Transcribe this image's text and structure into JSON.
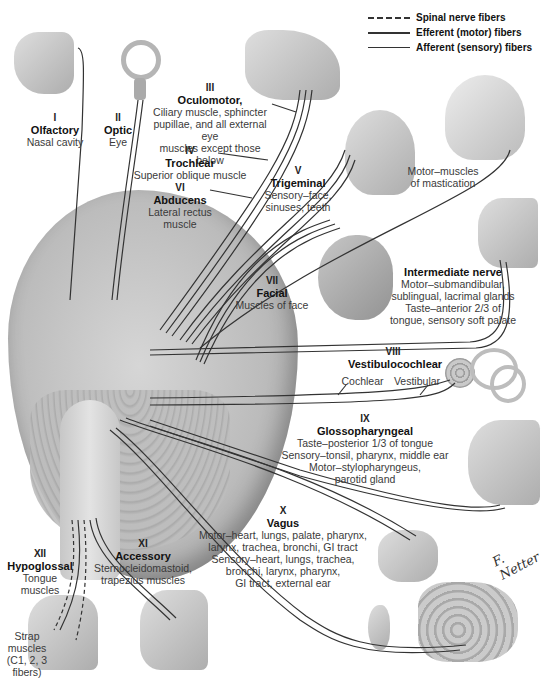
{
  "legend": {
    "items": [
      {
        "style": "dashed",
        "label": "Spinal nerve fibers"
      },
      {
        "style": "solid",
        "label": "Efferent (motor) fibers"
      },
      {
        "style": "thin",
        "label": "Afferent (sensory) fibers"
      }
    ]
  },
  "nerves": {
    "I": {
      "num": "I",
      "name": "Olfactory",
      "desc": [
        "Nasal cavity"
      ]
    },
    "II": {
      "num": "II",
      "name": "Optic",
      "desc": [
        "Eye"
      ]
    },
    "III": {
      "num": "III",
      "name": "Oculomotor,",
      "desc": [
        "Ciliary muscle, sphincter",
        "pupillae, and all external eye",
        "muscles except those below"
      ]
    },
    "IV": {
      "num": "IV",
      "name": "Trochlear",
      "desc": [
        "Superior oblique muscle"
      ]
    },
    "V": {
      "num": "V",
      "name": "Trigeminal",
      "desc": [
        "Sensory–face,",
        "sinuses, teeth"
      ],
      "motor_note": [
        "Motor–muscles",
        "of mastication"
      ]
    },
    "VI": {
      "num": "VI",
      "name": "Abducens",
      "desc": [
        "Lateral rectus",
        "muscle"
      ]
    },
    "VII": {
      "num": "VII",
      "name": "Facial",
      "desc": [
        "Muscles of face"
      ]
    },
    "intermediate": {
      "name": "Intermediate nerve",
      "desc": [
        "Motor–submandibular,",
        "sublingual, lacrimal glands",
        "Taste–anterior 2/3 of",
        "tongue, sensory soft palate"
      ]
    },
    "VIII": {
      "num": "VIII",
      "name": "Vestibulocochlear",
      "branches": [
        "Cochlear",
        "Vestibular"
      ]
    },
    "IX": {
      "num": "IX",
      "name": "Glossopharyngeal",
      "desc": [
        "Taste–posterior 1/3 of tongue",
        "Sensory–tonsil, pharynx, middle ear",
        "Motor–stylopharyngeus,",
        "parotid gland"
      ]
    },
    "X": {
      "num": "X",
      "name": "Vagus",
      "desc": [
        "Motor–heart, lungs, palate, pharynx,",
        "larynx, trachea, bronchi, GI tract",
        "Sensory–heart, lungs, trachea,",
        "bronchi, larynx, pharynx,",
        "GI tract, external ear"
      ]
    },
    "XI": {
      "num": "XI",
      "name": "Accessory",
      "desc": [
        "Sternocleidomastoid,",
        "trapezius muscles"
      ]
    },
    "XII": {
      "num": "XII",
      "name": "Hypoglossal",
      "desc": [
        "Tongue",
        "muscles"
      ]
    },
    "strap": {
      "desc": [
        "Strap",
        "muscles",
        "(C1, 2, 3",
        "fibers)"
      ]
    }
  },
  "illustrations": {
    "nasal_cavity": "nasal-cavity",
    "eye": "eyeball",
    "orbit": "orbit-eye-muscles",
    "face_sensory": "face-profile",
    "skull": "skull-mastication",
    "facial_muscles": "head-facial-muscles",
    "head_sagittal_upper": "head-sagittal-section",
    "inner_ear": "inner-ear",
    "head_sagittal_lower": "pharynx-section",
    "thoracic_organs": "heart-lungs",
    "ear": "external-ear",
    "gi_tract": "stomach-intestines",
    "neck_left": "tongue-neck",
    "neck_right": "neck-muscles",
    "brain": "brain-inferior-view"
  },
  "signature": "F. Netter",
  "colors": {
    "line": "#333333",
    "illustration": "#b0b0b0",
    "background": "#ffffff"
  }
}
